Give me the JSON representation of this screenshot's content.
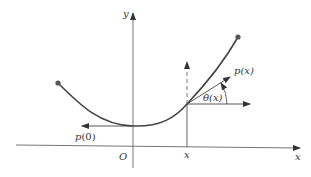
{
  "diagram": {
    "axes": {
      "x_label": "x",
      "y_label": "y",
      "origin_label": "O",
      "x_tick_label": "x"
    },
    "labels": {
      "tangent_vector": "p(x)",
      "angle": "θ(x)",
      "initial_vector_prefix": "p",
      "initial_vector_arg": "(0)"
    },
    "colors": {
      "curve": "#444444",
      "axes": "#555555",
      "endpoints": "#555555"
    }
  }
}
